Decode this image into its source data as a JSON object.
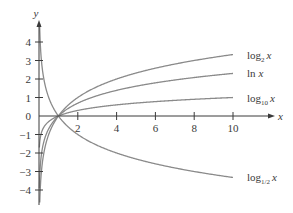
{
  "chart_data": {
    "type": "line",
    "title": "",
    "xlabel": "x",
    "ylabel": "y",
    "xlim": [
      0,
      11.3
    ],
    "ylim": [
      -4.4,
      4.6
    ],
    "grid": false,
    "legend": "inline labels at right end of each curve",
    "x_ticks": [
      2,
      4,
      6,
      8,
      10
    ],
    "x_tick_labels": [
      "2",
      "4",
      "6",
      "8",
      "10"
    ],
    "y_ticks": [
      -4,
      -3,
      -2,
      -1,
      0,
      1,
      2,
      3,
      4
    ],
    "y_tick_labels": [
      "−4",
      "−3",
      "−2",
      "−1",
      "0",
      "1",
      "2",
      "3",
      "4"
    ],
    "x_range_plotted": [
      0.05,
      10
    ],
    "series": [
      {
        "name": "log_2 x",
        "label_base": "log",
        "label_sub": "2",
        "label_var": "x",
        "base": 2,
        "end_value_at_10": 3.32
      },
      {
        "name": "ln x",
        "label_base": "ln",
        "label_sub": "",
        "label_var": "x",
        "base": 2.718281828,
        "end_value_at_10": 2.3
      },
      {
        "name": "log_10 x",
        "label_base": "log",
        "label_sub": "10",
        "label_var": "x",
        "base": 10,
        "end_value_at_10": 1.0
      },
      {
        "name": "log_1/2 x",
        "label_base": "log",
        "label_sub": "1/2",
        "label_var": "x",
        "base": 0.5,
        "end_value_at_10": -3.32
      }
    ],
    "annotations": [
      "All curves pass through (1, 0)"
    ]
  },
  "style": {
    "axis_color": "#3a3a3a",
    "curve_color": "#8a8a8a",
    "text_color": "#3a3a3a",
    "background": "#ffffff"
  },
  "layout": {
    "origin_px": [
      39,
      116
    ],
    "px_per_x": 19.4,
    "px_per_y": 18.5,
    "x_axis_end_px": 270,
    "y_axis_top_px": 22,
    "y_axis_bottom_px": 205
  }
}
